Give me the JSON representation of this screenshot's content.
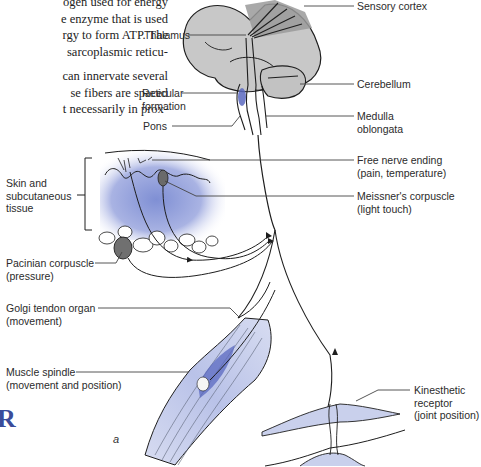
{
  "text_excerpt": {
    "lines": [
      "ogen used for energy",
      "e enzyme that is used",
      "rgy to form ATP. The",
      "sarcoplasmic reticu-",
      "",
      "can innervate several",
      "se fibers are spaced",
      "t necessarily in prox-"
    ]
  },
  "labels": {
    "sensory_cortex": "Sensory cortex",
    "thalamus": "Thalamus",
    "reticular_formation": [
      "Reticular",
      "formation"
    ],
    "pons": "Pons",
    "cerebellum": "Cerebellum",
    "medulla_oblongata": [
      "Medulla",
      "oblongata"
    ],
    "skin_tissue": [
      "Skin and",
      "subcutaneous",
      "tissue"
    ],
    "free_nerve_ending": [
      "Free nerve ending",
      "(pain, temperature)"
    ],
    "meissners_corpuscle": [
      "Meissner's corpuscle",
      "(light touch)"
    ],
    "pacinian_corpuscle": [
      "Pacinian corpuscle",
      "(pressure)"
    ],
    "golgi_tendon_organ": [
      "Golgi tendon organ",
      "(movement)"
    ],
    "muscle_spindle": [
      "Muscle spindle",
      "(movement and position)"
    ],
    "kinesthetic_receptor": [
      "Kinesthetic",
      "receptor",
      "(joint position)"
    ]
  },
  "panel_letter": "a",
  "section_letter": "R",
  "colors": {
    "brain_fill": "#c8c8c8",
    "cortex_highlight": "#9a9a9a",
    "skin_blue": "#8c9bd8",
    "muscle_blue": "#c9d0ec",
    "spindle_blue": "#5a68c0",
    "line": "#1e1e1e",
    "leader": "#444444",
    "accent_R": "#3a4c9a"
  }
}
